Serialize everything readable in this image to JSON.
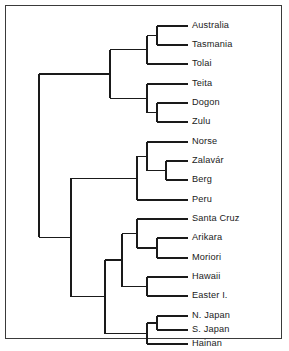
{
  "figure": {
    "type": "dendrogram",
    "orientation": "horizontal-right-leaves",
    "border_color": "#3a3a3a",
    "line_color": "#1a1a1a",
    "background": "#ffffff",
    "text_color": "#1a1a1a"
  },
  "labels": {
    "l0": "Australia",
    "l1": "Tasmania",
    "l2": "Tolai",
    "l3": "Teita",
    "l4": "Dogon",
    "l5": "Zulu",
    "l6": "Norse",
    "l7": "Zalavár",
    "l8": "Berg",
    "l9": "Peru",
    "l10": "Santa Cruz",
    "l11": "Arikara",
    "l12": "Moriori",
    "l13": "Hawaii",
    "l14": "Easter I.",
    "l15": "N. Japan",
    "l16": "S. Japan",
    "l17": "Hainan"
  },
  "chart_data": {
    "type": "dendrogram",
    "title": "",
    "xlabel": "",
    "ylabel": "",
    "leaf_order": [
      "Australia",
      "Tasmania",
      "Tolai",
      "Teita",
      "Dogon",
      "Zulu",
      "Norse",
      "Zalavár",
      "Berg",
      "Peru",
      "Santa Cruz",
      "Arikara",
      "Moriori",
      "Hawaii",
      "Easter I.",
      "N. Japan",
      "S. Japan",
      "Hainan"
    ],
    "leaf_count": 18,
    "leaf_y": [
      26,
      45,
      64,
      84,
      103,
      122,
      142,
      161,
      180,
      200,
      219,
      238,
      258,
      277,
      296,
      316,
      330,
      344
    ],
    "leaf_tip_x": [
      168,
      168,
      157,
      157,
      168,
      168,
      157,
      176,
      176,
      157,
      147,
      168,
      168,
      157,
      157,
      168,
      168,
      157
    ],
    "merges": [
      {
        "name": "Australia+Tasmania",
        "x": 157,
        "children": [
          "Australia",
          "Tasmania"
        ]
      },
      {
        "name": "(Australia,Tasmania)+Tolai",
        "x": 147,
        "children": [
          "Australia+Tasmania",
          "Tolai"
        ]
      },
      {
        "name": "Dogon+Zulu",
        "x": 157,
        "children": [
          "Dogon",
          "Zulu"
        ]
      },
      {
        "name": "Teita+(Dogon,Zulu)",
        "x": 147,
        "children": [
          "Teita",
          "Dogon+Zulu"
        ]
      },
      {
        "name": "Australasian+African",
        "x": 110,
        "children": [
          "(Australia,Tasmania)+Tolai",
          "Teita+(Dogon,Zulu)"
        ]
      },
      {
        "name": "Zalavar+Berg",
        "x": 166,
        "children": [
          "Zalavár",
          "Berg"
        ]
      },
      {
        "name": "Norse+(Zalavar,Berg)",
        "x": 147,
        "children": [
          "Norse",
          "Zalavar+Berg"
        ]
      },
      {
        "name": "European+Peru",
        "x": 137,
        "children": [
          "Norse+(Zalavar,Berg)",
          "Peru"
        ]
      },
      {
        "name": "Arikara+Moriori",
        "x": 157,
        "children": [
          "Arikara",
          "Moriori"
        ]
      },
      {
        "name": "SantaCruz+(Arikara,Moriori)",
        "x": 137,
        "children": [
          "Santa Cruz",
          "Arikara+Moriori"
        ]
      },
      {
        "name": "Hawaii+EasterI",
        "x": 147,
        "children": [
          "Hawaii",
          "Easter I."
        ]
      },
      {
        "name": "Amerind+Polynesian",
        "x": 122,
        "children": [
          "SantaCruz+(Arikara,Moriori)",
          "Hawaii+EasterI"
        ]
      },
      {
        "name": "NJapan+SJapan",
        "x": 157,
        "children": [
          "N. Japan",
          "S. Japan"
        ]
      },
      {
        "name": "(NJapan,SJapan)+Hainan",
        "x": 147,
        "children": [
          "NJapan+SJapan",
          "Hainan"
        ]
      },
      {
        "name": "Pacific+EastAsian",
        "x": 105,
        "children": [
          "Amerind+Polynesian",
          "(NJapan,SJapan)+Hainan"
        ]
      },
      {
        "name": "European+PacificAsian",
        "x": 71,
        "children": [
          "European+Peru",
          "Pacific+EastAsian"
        ]
      },
      {
        "name": "root",
        "x": 39,
        "children": [
          "Australasian+African",
          "European+PacificAsian"
        ]
      }
    ]
  }
}
